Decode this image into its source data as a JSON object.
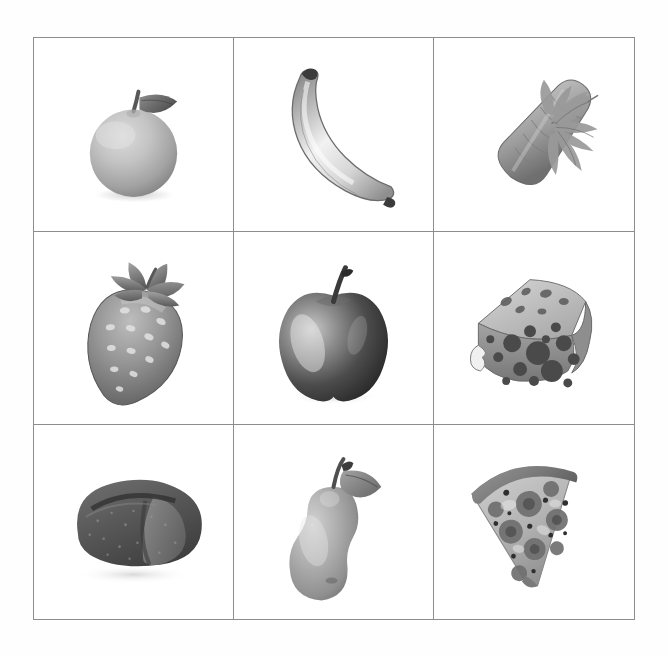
{
  "page": {
    "background_color": "#fefefe",
    "grid_line_color": "#8d8d8d",
    "cell_background": "#ffffff",
    "rendering": "grayscale photorealistic illustrations",
    "columns": 3,
    "rows": 3
  },
  "grid": {
    "cells": [
      {
        "position": "row-1-col-1",
        "label": "orange",
        "icon": "orange-fruit-icon",
        "category": "fruit",
        "description": "Round citrus fruit with short stem and a single leaf at top right"
      },
      {
        "position": "row-1-col-2",
        "label": "banana",
        "icon": "banana-icon",
        "category": "fruit",
        "description": "Curved banana with dark tips, arcing down to the right"
      },
      {
        "position": "row-1-col-3",
        "label": "carrot",
        "icon": "carrot-icon",
        "category": "vegetable",
        "description": "Tapered carrot angled diagonally with feathery green tops at upper right"
      },
      {
        "position": "row-2-col-1",
        "label": "strawberry",
        "icon": "strawberry-icon",
        "category": "fruit",
        "description": "Tilted strawberry with mottled seed texture and spiky calyx crown"
      },
      {
        "position": "row-2-col-2",
        "label": "apple",
        "icon": "apple-icon",
        "category": "fruit",
        "description": "Dark glossy apple with upright stem and bright specular highlight"
      },
      {
        "position": "row-2-col-3",
        "label": "cheese",
        "icon": "cheese-wedge-icon",
        "category": "dairy",
        "description": "Swiss cheese wedge with many round holes and lighter top face"
      },
      {
        "position": "row-3-col-1",
        "label": "bread",
        "icon": "bread-loaf-icon",
        "category": "grain",
        "description": "Rustic rounded loaf with diagonal scoring and speckled crust"
      },
      {
        "position": "row-3-col-2",
        "label": "pear",
        "icon": "pear-icon",
        "category": "fruit",
        "description": "Pear with curved stem and one leaf pointing to the right"
      },
      {
        "position": "row-3-col-3",
        "label": "pizza",
        "icon": "pizza-slice-icon",
        "category": "prepared",
        "description": "Triangular pizza slice, crust arc at upper left, tip pointing down right, pepperoni toppings"
      }
    ]
  }
}
